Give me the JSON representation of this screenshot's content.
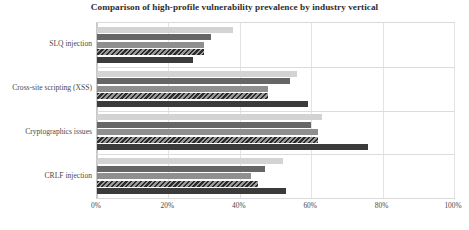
{
  "chart_data": {
    "type": "bar",
    "orientation": "horizontal",
    "title": "Comparison of high-profile vulnerability prevalence by industry vertical",
    "xlabel": "",
    "ylabel": "",
    "xlim": [
      0,
      100
    ],
    "xtick_labels": [
      "0%",
      "20%",
      "40%",
      "60%",
      "80%",
      "100%"
    ],
    "xtick_values": [
      0,
      20,
      40,
      60,
      80,
      100
    ],
    "grid": true,
    "legend": "none",
    "categories": [
      "SLQ injection",
      "Cross-site scripting (XSS)",
      "Cryptographics issues",
      "CRLF injection"
    ],
    "series": [
      {
        "name": "series-1",
        "style": "light-gray",
        "color": "#d3d3d3",
        "values": [
          38,
          56,
          63,
          52
        ]
      },
      {
        "name": "series-2",
        "style": "dark-gray",
        "color": "#666666",
        "values": [
          32,
          54,
          60,
          47
        ]
      },
      {
        "name": "series-3",
        "style": "medium-gray",
        "color": "#8f8f8f",
        "values": [
          30,
          48,
          62,
          43
        ]
      },
      {
        "name": "series-4",
        "style": "hatched-gray",
        "color": "#5a5a5a",
        "values": [
          30,
          48,
          62,
          45
        ]
      },
      {
        "name": "series-5",
        "style": "near-black",
        "color": "#3b3b3b",
        "values": [
          27,
          59,
          76,
          53
        ]
      }
    ]
  }
}
